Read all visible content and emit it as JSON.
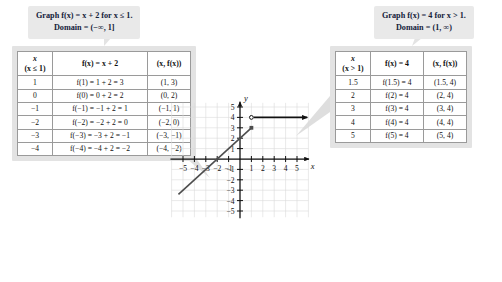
{
  "callouts": {
    "left": {
      "line1": "Graph f(x) = x + 2 for x ≤ 1.",
      "line2": "Domain = (−∞, 1]"
    },
    "right": {
      "line1": "Graph f(x) = 4 for x > 1.",
      "line2": "Domain = (1, ∞)"
    }
  },
  "tables": {
    "left": {
      "headers": {
        "x_top": "x",
        "x_sub": "(x ≤ 1)",
        "fx": "f(x) = x + 2",
        "pair": "(x, f(x))"
      },
      "rows": [
        {
          "x": "1",
          "fx": "f(1) = 1 + 2 = 3",
          "pair": "(1, 3)"
        },
        {
          "x": "0",
          "fx": "f(0) = 0 + 2 = 2",
          "pair": "(0, 2)"
        },
        {
          "x": "−1",
          "fx": "f(−1) = −1 + 2 = 1",
          "pair": "(−1, 1)"
        },
        {
          "x": "−2",
          "fx": "f(−2) = −2 + 2 = 0",
          "pair": "(−2, 0)"
        },
        {
          "x": "−3",
          "fx": "f(−3) = −3 + 2 = −1",
          "pair": "(−3, −1)"
        },
        {
          "x": "−4",
          "fx": "f(−4) = −4 + 2 = −2",
          "pair": "(−4, −2)"
        }
      ]
    },
    "right": {
      "headers": {
        "x_top": "x",
        "x_sub": "(x > 1)",
        "fx": "f(x) = 4",
        "pair": "(x, f(x))"
      },
      "rows": [
        {
          "x": "1.5",
          "fx": "f(1.5) = 4",
          "pair": "(1.5, 4)"
        },
        {
          "x": "2",
          "fx": "f(2) = 4",
          "pair": "(2, 4)"
        },
        {
          "x": "3",
          "fx": "f(3) = 4",
          "pair": "(3, 4)"
        },
        {
          "x": "4",
          "fx": "f(4) = 4",
          "pair": "(4, 4)"
        },
        {
          "x": "5",
          "fx": "f(5) = 4",
          "pair": "(5, 4)"
        }
      ]
    }
  },
  "chart_data": {
    "type": "line",
    "title": "",
    "xlabel": "x",
    "ylabel": "y",
    "xlim": [
      -6,
      6
    ],
    "ylim": [
      -5.8,
      5.6
    ],
    "xticks": [
      -5,
      -4,
      -3,
      -2,
      -1,
      1,
      2,
      3,
      4,
      5
    ],
    "yticks": [
      -5,
      -4,
      -3,
      -2,
      -1,
      1,
      2,
      3,
      4,
      5
    ],
    "grid": true,
    "series": [
      {
        "name": "f(x) = x + 2 for x ≤ 1",
        "type": "ray",
        "points": [
          [
            -5.4,
            -3.4
          ],
          [
            1,
            3
          ]
        ],
        "endpoint": {
          "x": 1,
          "y": 3,
          "marker": "closed"
        },
        "direction": "down-left",
        "color": "#4d4d4d"
      },
      {
        "name": "f(x) = 4 for x > 1",
        "type": "ray",
        "points": [
          [
            1,
            4
          ],
          [
            5.9,
            4
          ]
        ],
        "endpoint": {
          "x": 1,
          "y": 4,
          "marker": "open"
        },
        "direction": "right-arrow",
        "color": "#111111"
      }
    ]
  },
  "colors": {
    "callout_bg": "#e9e9e9",
    "callout_text": "#14213a",
    "panel_bg": "#e3e3e3",
    "table_bg": "#ffffff",
    "grid": "#d8d8d8",
    "axis": "#111111",
    "line_left": "#4d4d4d",
    "line_right": "#111111",
    "connector": "#d5d5d5"
  }
}
